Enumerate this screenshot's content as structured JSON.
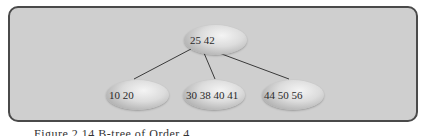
{
  "diagram": {
    "type": "b-tree",
    "root": {
      "keys": "25 42"
    },
    "children": [
      {
        "keys": "10 20"
      },
      {
        "keys": "30 38 40 41"
      },
      {
        "keys": "44 50 56"
      }
    ],
    "edges": [
      {
        "from": "root",
        "to": "child-0"
      },
      {
        "from": "root",
        "to": "child-1"
      },
      {
        "from": "root",
        "to": "child-2"
      }
    ]
  },
  "caption": "Figure 2.14 B-tree of Order 4"
}
